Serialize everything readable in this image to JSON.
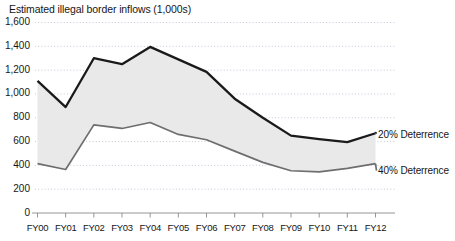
{
  "chart_data": {
    "type": "area",
    "title": "Estimated illegal border inflows (1,000s)",
    "xlabel": "",
    "ylabel": "",
    "grid": true,
    "legend_position": "right-inline",
    "categories": [
      "FY00",
      "FY01",
      "FY02",
      "FY03",
      "FY04",
      "FY05",
      "FY06",
      "FY07",
      "FY08",
      "FY09",
      "FY10",
      "FY11",
      "FY12"
    ],
    "ylim": [
      0,
      1600
    ],
    "yticks": [
      0,
      200,
      400,
      600,
      800,
      1000,
      1200,
      1400,
      1600
    ],
    "ytick_labels": [
      "0",
      "200",
      "400",
      "600",
      "800",
      "1,000",
      "1,200",
      "1,400",
      "1,600"
    ],
    "series": [
      {
        "name": "20% Deterrence",
        "values": [
          1110,
          890,
          1300,
          1250,
          1395,
          1290,
          1185,
          960,
          800,
          650,
          620,
          595,
          670
        ]
      },
      {
        "name": "40% Deterrence",
        "values": [
          415,
          365,
          740,
          710,
          760,
          660,
          615,
          520,
          425,
          355,
          345,
          375,
          415
        ]
      }
    ],
    "band_fill_color": "#e9e9e9",
    "upper_line_color": "#1a1a1a",
    "lower_line_color": "#6e6e6e",
    "gridline_color": "#b9c4d4"
  },
  "labels": {
    "upper_series": "20% Deterrence",
    "lower_series": "40% Deterrence"
  }
}
